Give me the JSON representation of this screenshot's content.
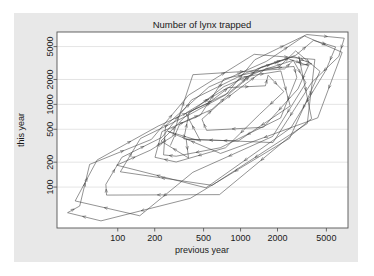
{
  "figure": {
    "title": "Number of lynx trapped",
    "background_color": "#e8e8e8",
    "plot_background_color": "#ffffff",
    "line_color": "#3a3a3a",
    "grid_color": "#d9d9d9",
    "frame_color": "#555555"
  },
  "chart_data": {
    "type": "line",
    "title": "Number of lynx trapped",
    "xlabel": "previous year",
    "ylabel": "this year",
    "xscale": "log",
    "yscale": "log",
    "grid": true,
    "legend": "none",
    "xlim": [
      32,
      7500
    ],
    "ylim": [
      32,
      7500
    ],
    "xticks": [
      100,
      200,
      500,
      1000,
      2000,
      5000
    ],
    "xticklabels": [
      "100",
      "200",
      "500",
      "1000",
      "2000",
      "5000"
    ],
    "yticks": [
      100,
      200,
      500,
      1000,
      2000,
      5000
    ],
    "yticklabels": [
      "100",
      "200",
      "500",
      "1000",
      "2000",
      "5000"
    ],
    "series_name": "lynx lag-1 trajectory",
    "arrows": true,
    "series_values": [
      269,
      321,
      585,
      871,
      1475,
      2821,
      3928,
      5943,
      4950,
      2577,
      523,
      98,
      184,
      279,
      409,
      2285,
      2685,
      3409,
      1824,
      409,
      151,
      45,
      68,
      213,
      546,
      1033,
      2129,
      2536,
      957,
      361,
      377,
      225,
      360,
      731,
      1638,
      2725,
      2871,
      2119,
      684,
      299,
      236,
      245,
      552,
      1623,
      3311,
      6721,
      4254,
      687,
      255,
      473,
      358,
      784,
      1594,
      1676,
      2251,
      1426,
      756,
      299,
      201,
      229,
      469,
      736,
      2042,
      2811,
      4431,
      2511,
      389,
      73,
      39,
      49,
      59,
      188,
      377,
      1292,
      4031,
      3495,
      587,
      105,
      153,
      387,
      758,
      1307,
      3465,
      6991,
      6313,
      3794,
      1836,
      345,
      382,
      808,
      1388,
      2713,
      3800,
      3091,
      2985,
      3790,
      674,
      81,
      80,
      108,
      229,
      399,
      1132,
      2432,
      3574,
      2935,
      1537,
      529,
      485,
      662,
      1000,
      1590,
      2657,
      3396
    ]
  }
}
